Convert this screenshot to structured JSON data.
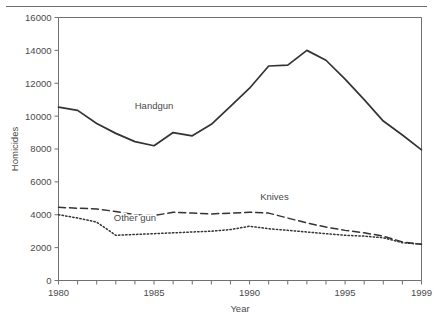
{
  "chart_data": {
    "type": "line",
    "title": "",
    "xlabel": "Year",
    "ylabel": "Homicides",
    "xlim": [
      1980,
      1999
    ],
    "ylim": [
      0,
      16000
    ],
    "grid": false,
    "legend_position": "inline-annotations",
    "x": [
      1980,
      1981,
      1982,
      1983,
      1984,
      1985,
      1986,
      1987,
      1988,
      1989,
      1990,
      1991,
      1992,
      1993,
      1994,
      1995,
      1996,
      1997,
      1998,
      1999
    ],
    "x_tick_labels": [
      "1980",
      "1985",
      "1990",
      "1995",
      "1999"
    ],
    "x_tick_values": [
      1980,
      1985,
      1990,
      1995,
      1999
    ],
    "y_tick_labels": [
      "0",
      "2000",
      "4000",
      "6000",
      "8000",
      "10000",
      "12000",
      "14000",
      "16000"
    ],
    "y_tick_values": [
      0,
      2000,
      4000,
      6000,
      8000,
      10000,
      12000,
      14000,
      16000
    ],
    "series": [
      {
        "name": "Handgun",
        "style": "solid",
        "color": "#333333",
        "label_x": 1985.0,
        "label_y": 10450,
        "values": [
          10550,
          10350,
          9550,
          8950,
          8450,
          8200,
          9000,
          8800,
          9500,
          10600,
          11700,
          13050,
          13100,
          14000,
          13400,
          12250,
          11000,
          9700,
          8850,
          7950
        ]
      },
      {
        "name": "Knives",
        "style": "dashed",
        "color": "#333333",
        "label_x": 1991.3,
        "label_y": 4900,
        "values": [
          4450,
          4400,
          4350,
          4200,
          4000,
          3950,
          4150,
          4100,
          4050,
          4100,
          4150,
          4100,
          3800,
          3500,
          3250,
          3050,
          2900,
          2700,
          2350,
          2200
        ]
      },
      {
        "name": "Other gun",
        "style": "dotted",
        "color": "#333333",
        "label_x": 1984.0,
        "label_y": 3650,
        "values": [
          4000,
          3800,
          3550,
          2750,
          2800,
          2850,
          2900,
          2950,
          3000,
          3100,
          3300,
          3150,
          3050,
          2950,
          2850,
          2750,
          2700,
          2600,
          2300,
          2200
        ]
      }
    ]
  },
  "axis": {
    "y_title": "Homicides",
    "x_title": "Year"
  }
}
